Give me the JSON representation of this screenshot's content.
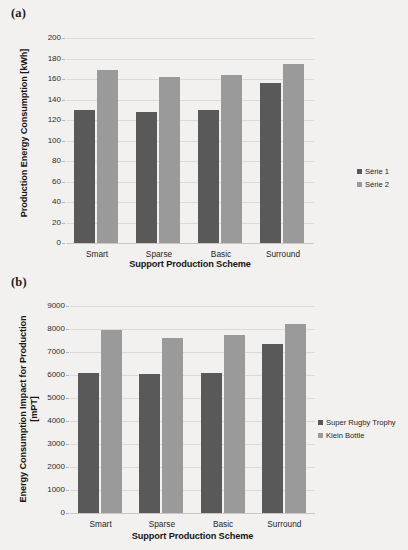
{
  "figure": {
    "panels": [
      {
        "label": "(a)"
      },
      {
        "label": "(b)"
      }
    ]
  },
  "colors": {
    "series1": "#595959",
    "series2": "#9a9a9a",
    "background": "#f3f1ef",
    "gridline": "#dcdad7",
    "text": "#1f1f1f"
  },
  "chart_data": [
    {
      "type": "bar",
      "panel": "(a)",
      "title": "",
      "xlabel": "Support Production Scheme",
      "ylabel": "Production Energy Consumption [kWh]",
      "categories": [
        "Smart",
        "Sparse",
        "Basic",
        "Surround"
      ],
      "yticks": [
        0,
        20,
        40,
        60,
        80,
        100,
        120,
        140,
        160,
        180,
        200
      ],
      "ylim": [
        0,
        200
      ],
      "grid": true,
      "legend_position": "right",
      "series": [
        {
          "name": "Série 1",
          "color": "#595959",
          "values": [
            130,
            128,
            130,
            156
          ]
        },
        {
          "name": "Série 2",
          "color": "#9a9a9a",
          "values": [
            169,
            162,
            164,
            175
          ]
        }
      ]
    },
    {
      "type": "bar",
      "panel": "(b)",
      "title": "",
      "xlabel": "Support Production Scheme",
      "ylabel": "Energy Consumption Impact for Production [mPT]",
      "ylabel_line1": "Energy Consumption Impact for Production",
      "ylabel_line2": "[mPT]",
      "categories": [
        "Smart",
        "Sparse",
        "Basic",
        "Surround"
      ],
      "yticks": [
        0,
        1000,
        2000,
        3000,
        4000,
        5000,
        6000,
        7000,
        8000,
        9000
      ],
      "ylim": [
        0,
        9000
      ],
      "grid": true,
      "legend_position": "right",
      "series": [
        {
          "name": "Super Rugby Trophy",
          "color": "#595959",
          "values": [
            6100,
            6030,
            6080,
            7340
          ]
        },
        {
          "name": "Klein Bottle",
          "color": "#9a9a9a",
          "values": [
            7950,
            7630,
            7720,
            8220
          ]
        }
      ]
    }
  ]
}
